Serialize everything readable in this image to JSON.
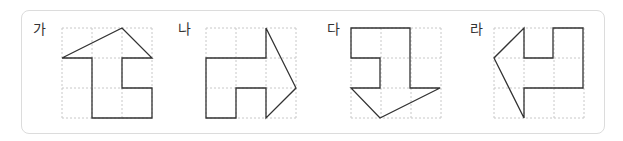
{
  "figures": [
    {
      "label": "가",
      "label_x": 33,
      "label_y": 21,
      "grid": {
        "x": 62,
        "y": 28,
        "cols": 3,
        "rows": 3,
        "cell": 30
      },
      "points": "62,58 92,58 92,118 152,118 152,88 122,88 122,58 152,58 122,28"
    },
    {
      "label": "나",
      "label_x": 178,
      "label_y": 21,
      "grid": {
        "x": 206,
        "y": 28,
        "cols": 3,
        "rows": 3,
        "cell": 30
      },
      "points": "206,58 266,58 266,28 296,88 266,118 266,88 236,88 236,118 206,118"
    },
    {
      "label": "다",
      "label_x": 327,
      "label_y": 21,
      "grid": {
        "x": 351,
        "y": 28,
        "cols": 3,
        "rows": 3,
        "cell": 30
      },
      "points": "351,28 410,28 410,88 440,88 380,118 351,88 380,88 380,58 351,58"
    },
    {
      "label": "라",
      "label_x": 470,
      "label_y": 21,
      "grid": {
        "x": 494,
        "y": 28,
        "cols": 3,
        "rows": 3,
        "cell": 30
      },
      "points": "524,28 524,58 553,58 553,28 583,28 583,88 524,88 524,118 494,58"
    }
  ],
  "colors": {
    "grid": "#c8c8c8",
    "shape": "#333333",
    "border": "#dcdcdc"
  }
}
